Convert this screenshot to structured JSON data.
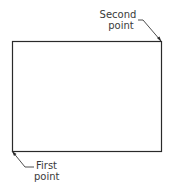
{
  "diagram": {
    "rectangle": {
      "x": 12,
      "y": 41,
      "width": 149,
      "height": 110,
      "stroke": "#2a2a2a"
    },
    "labels": {
      "second_point": {
        "line1": "Second",
        "line2": "point"
      },
      "first_point": {
        "line1": "First",
        "line2": "point"
      }
    }
  }
}
